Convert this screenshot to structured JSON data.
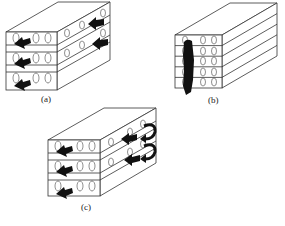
{
  "figure": {
    "panels": [
      {
        "id": "a",
        "label": "(a)",
        "layers": 3,
        "description": "Three-layer stacked block with flow arrows entering front face and exiting on side face"
      },
      {
        "id": "b",
        "label": "(b)",
        "layers": 5,
        "description": "Five-layer stacked block with vertical flow path through front face"
      },
      {
        "id": "c",
        "label": "(c)",
        "layers": 3,
        "description": "Three-layer stacked block with flow arrows and U-turn return arrows on side face"
      }
    ],
    "colors": {
      "line": "#333333",
      "arrow": "#111111",
      "background": "#ffffff"
    }
  }
}
